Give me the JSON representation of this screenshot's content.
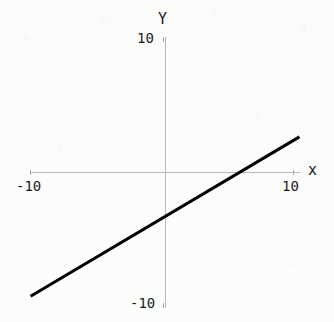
{
  "chart_data": {
    "type": "line",
    "title": "",
    "subtitle": "",
    "xlabel": "x",
    "ylabel": "Y",
    "xlim": [
      -10,
      10
    ],
    "ylim": [
      -10,
      10
    ],
    "grid": false,
    "legend": null,
    "axis_style": "cartesian-cross",
    "x_ticks": [
      -10,
      10
    ],
    "y_ticks": [
      -10,
      10
    ],
    "x_tick_labels": [
      "-10",
      "10"
    ],
    "y_tick_labels": [
      "-10",
      "10"
    ],
    "series": [
      {
        "name": "line",
        "color": "#000000",
        "linewidth": 3,
        "slope": 0.56,
        "intercept": -3.3,
        "x": [
          -10.5,
          -5,
          0,
          5.9,
          10.5
        ],
        "y": [
          -9.2,
          -6.1,
          -3.3,
          0,
          2.6
        ],
        "endpoints": [
          {
            "x": -10.5,
            "y": -9.2
          },
          {
            "x": 10.5,
            "y": 2.6
          }
        ]
      }
    ],
    "annotations": []
  },
  "axes": {
    "y_axis_name": "Y",
    "x_axis_name": "x",
    "y_max_label": "10",
    "y_min_label": "-10",
    "x_min_label": "-10",
    "x_max_label": "10"
  },
  "colors": {
    "background": "#fdfdfc",
    "axis": "#b9b9b9",
    "tick": "#a8a8a8",
    "text": "#1a1a1a",
    "data_line": "#000000"
  }
}
